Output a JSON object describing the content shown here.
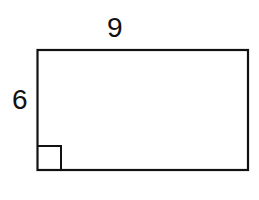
{
  "diagram": {
    "type": "rectangle",
    "labels": {
      "top_side": "9",
      "left_side": "6"
    },
    "dimensions": {
      "width": 9,
      "height": 6
    },
    "right_angle_marker": "bottom-left",
    "stroke_color": "#111111",
    "background_color": "#ffffff"
  }
}
